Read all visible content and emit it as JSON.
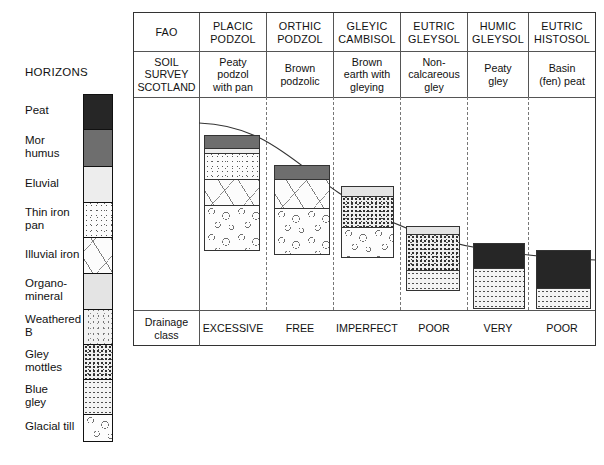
{
  "legend": {
    "title": "HORIZONS",
    "items": [
      {
        "label": "Peat",
        "fill": "f-peat",
        "color": "#262626",
        "top": 0,
        "h": 35
      },
      {
        "label": "Mor\nhumus",
        "fill": "f-mor",
        "color": "#6e6e6e",
        "top": 35,
        "h": 37
      },
      {
        "label": "Eluvial",
        "fill": "f-eluvial",
        "color": "#ededed",
        "top": 72,
        "h": 36
      },
      {
        "label": "Thin iron\npan",
        "fill": "f-pan",
        "color": "#fbfbfb",
        "top": 108,
        "h": 35
      },
      {
        "label": "Illuvial iron",
        "fill": "f-illuvial",
        "color": "#fcfcfc",
        "top": 143,
        "h": 36
      },
      {
        "label": "Organo-\nmineral",
        "fill": "f-orgmin",
        "color": "#e4e4e4",
        "top": 179,
        "h": 36
      },
      {
        "label": "Weathered\nB",
        "fill": "f-weathb",
        "color": "#f2f2f2",
        "top": 215,
        "h": 35
      },
      {
        "label": "Gley\nmottles",
        "fill": "f-gleym",
        "color": "#efefef",
        "top": 250,
        "h": 35
      },
      {
        "label": "Blue\ngley",
        "fill": "f-bluegley",
        "color": "#f4f4f4",
        "top": 285,
        "h": 35
      },
      {
        "label": "Glacial till",
        "fill": "f-till",
        "color": "#fdfdfd",
        "top": 320,
        "h": 26
      }
    ]
  },
  "table": {
    "row_labels": {
      "fao": "FAO",
      "soil_survey": "SOIL\nSURVEY\nSCOTLAND",
      "drainage": "Drainage\nclass"
    },
    "columns": [
      {
        "fao": "PLACIC\nPODZOL",
        "sss": "Peaty\npodzol\nwith pan",
        "drainage": "EXCESSIVE"
      },
      {
        "fao": "ORTHIC\nPODZOL",
        "sss": "Brown\npodzolic",
        "drainage": "FREE"
      },
      {
        "fao": "GLEYIC\nCAMBISOL",
        "sss": "Brown\nearth with\ngleying",
        "drainage": "IMPERFECT"
      },
      {
        "fao": "EUTRIC\nGLEYSOL",
        "sss": "Non-\ncalcareous\ngley",
        "drainage": "POOR"
      },
      {
        "fao": "HUMIC\nGLEYSOL",
        "sss": "Peaty\ngley",
        "drainage": "VERY"
      },
      {
        "fao": "EUTRIC\nHISTOSOL",
        "sss": "Basin\n(fen) peat",
        "drainage": "POOR"
      }
    ]
  },
  "profiles": [
    {
      "name": "placic-podzol-profile",
      "layers": [
        {
          "horizon": "Mor humus",
          "fill": "f-mor",
          "h": 13
        },
        {
          "horizon": "Eluvial",
          "fill": "f-eluvial",
          "h": 5
        },
        {
          "horizon": "Thin iron pan",
          "fill": "f-pan",
          "h": 26
        },
        {
          "horizon": "Illuvial iron",
          "fill": "f-illuvial",
          "h": 26
        },
        {
          "horizon": "Glacial till",
          "fill": "f-till",
          "h": 46
        }
      ]
    },
    {
      "name": "orthic-podzol-profile",
      "layers": [
        {
          "horizon": "Mor humus",
          "fill": "f-mor",
          "h": 14
        },
        {
          "horizon": "Illuvial iron",
          "fill": "f-illuvial",
          "h": 29
        },
        {
          "horizon": "Glacial till",
          "fill": "f-till",
          "h": 47
        }
      ]
    },
    {
      "name": "gleyic-cambisol-profile",
      "layers": [
        {
          "horizon": "Organo-mineral",
          "fill": "f-orgmin",
          "h": 10
        },
        {
          "horizon": "Gley mottles",
          "fill": "f-gleym",
          "h": 31
        },
        {
          "horizon": "Glacial till",
          "fill": "f-till",
          "h": 31
        }
      ]
    },
    {
      "name": "eutric-gleysol-profile",
      "layers": [
        {
          "horizon": "Organo-mineral",
          "fill": "f-orgmin",
          "h": 8
        },
        {
          "horizon": "Gley mottles",
          "fill": "f-gleym",
          "h": 36
        },
        {
          "horizon": "Blue gley",
          "fill": "f-bluegley",
          "h": 21
        }
      ]
    },
    {
      "name": "humic-gleysol-profile",
      "layers": [
        {
          "horizon": "Peat",
          "fill": "f-peat",
          "h": 25
        },
        {
          "horizon": "Blue gley",
          "fill": "f-bluegley",
          "h": 41
        }
      ]
    },
    {
      "name": "eutric-histosol-profile",
      "layers": [
        {
          "horizon": "Peat",
          "fill": "f-peat",
          "h": 38
        },
        {
          "horizon": "Blue gley",
          "fill": "f-bluegley",
          "h": 21
        }
      ]
    }
  ],
  "style": {
    "frame_border": "#333333",
    "grid_line": "#555555",
    "dashed_divider": "#777777",
    "surface_curve": "#333333"
  }
}
